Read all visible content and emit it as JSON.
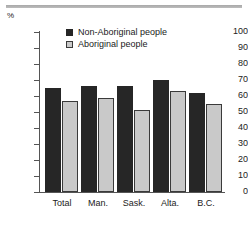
{
  "unit_label": "%",
  "legend": {
    "items": [
      {
        "label": "Non-Aboriginal people",
        "color": "#262626",
        "swatch": "filled-square-icon"
      },
      {
        "label": "Aboriginal people",
        "color": "#c9c9c9",
        "swatch": "outlined-square-icon"
      }
    ]
  },
  "chart_data": {
    "type": "bar",
    "title": "",
    "xlabel": "",
    "ylabel": "%",
    "ylim": [
      0,
      100
    ],
    "yticks": [
      0,
      10,
      20,
      30,
      40,
      50,
      60,
      70,
      80,
      90,
      100
    ],
    "grid": false,
    "legend_position": "inside-top-left",
    "categories": [
      "Total",
      "Man.",
      "Sask.",
      "Alta.",
      "B.C."
    ],
    "series": [
      {
        "name": "Non-Aboriginal people",
        "color": "#262626",
        "values": [
          65,
          66,
          66,
          70,
          62
        ]
      },
      {
        "name": "Aboriginal people",
        "color": "#c9c9c9",
        "values": [
          57,
          59,
          51,
          63,
          55
        ]
      }
    ]
  }
}
